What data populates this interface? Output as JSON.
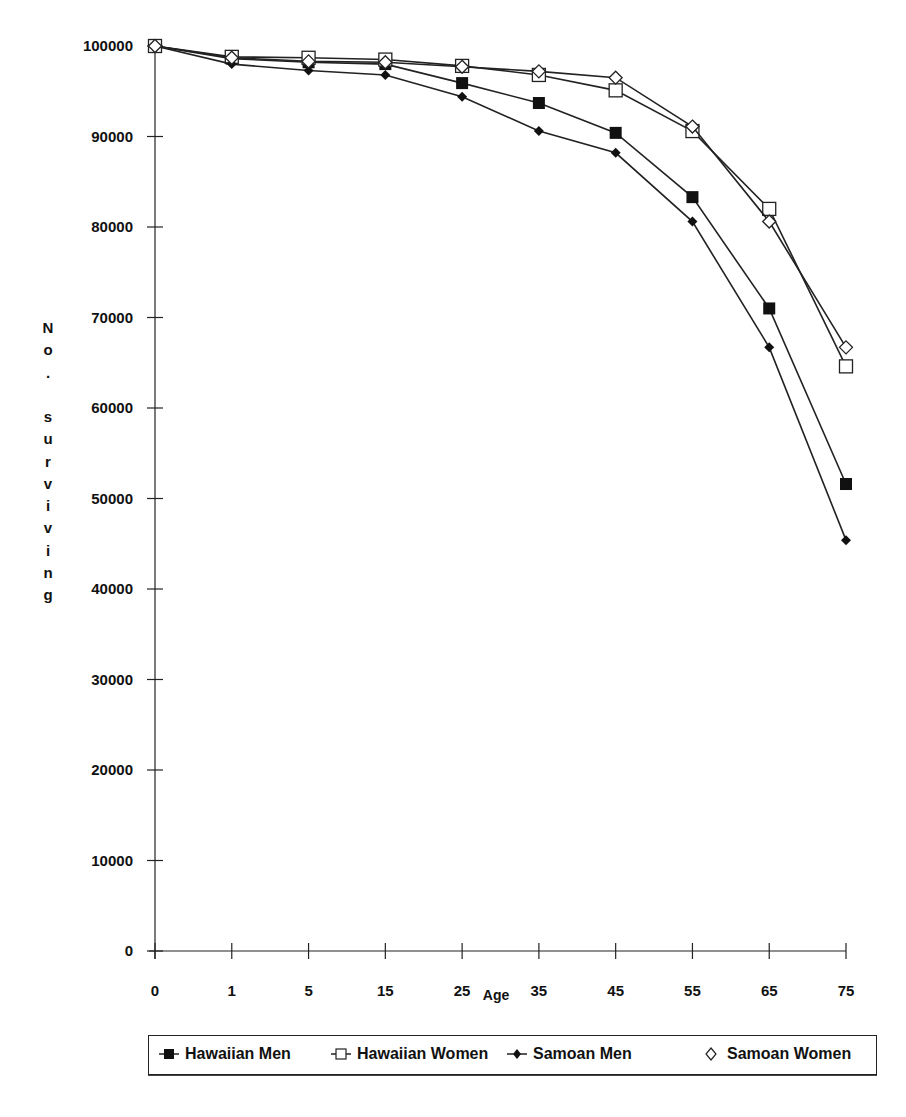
{
  "chart_data": {
    "type": "line",
    "title": "",
    "xlabel": "Age",
    "ylabel": "No. surviving",
    "categories": [
      "0",
      "1",
      "5",
      "15",
      "25",
      "35",
      "45",
      "55",
      "65",
      "75"
    ],
    "ylim": [
      0,
      100000
    ],
    "yticks": [
      0,
      10000,
      20000,
      30000,
      40000,
      50000,
      60000,
      70000,
      80000,
      90000,
      100000
    ],
    "grid": false,
    "legend_position": "bottom",
    "series": [
      {
        "name": "Hawaiian Men",
        "marker": "filled-square",
        "values": [
          100000,
          98600,
          98200,
          98000,
          95900,
          93700,
          90400,
          83300,
          71000,
          51600
        ]
      },
      {
        "name": "Hawaiian Women",
        "marker": "open-square",
        "values": [
          100000,
          98800,
          98700,
          98500,
          97800,
          96800,
          95100,
          90600,
          82000,
          64600
        ]
      },
      {
        "name": "Samoan Men",
        "marker": "filled-diamond",
        "values": [
          100000,
          98000,
          97300,
          96800,
          94400,
          90600,
          88200,
          80600,
          66700,
          45400
        ]
      },
      {
        "name": "Samoan Women",
        "marker": "open-diamond",
        "values": [
          100000,
          98700,
          98300,
          98200,
          97700,
          97200,
          96500,
          91100,
          80600,
          66700
        ]
      }
    ]
  },
  "legend": {
    "items": [
      {
        "label": "Hawaiian Men",
        "icon": "filled-square-icon"
      },
      {
        "label": "Hawaiian Women",
        "icon": "open-square-icon"
      },
      {
        "label": "Samoan Men",
        "icon": "filled-diamond-icon"
      },
      {
        "label": "Samoan Women",
        "icon": "open-diamond-icon"
      }
    ]
  },
  "colors": {
    "line": "#222222",
    "background": "#ffffff"
  }
}
